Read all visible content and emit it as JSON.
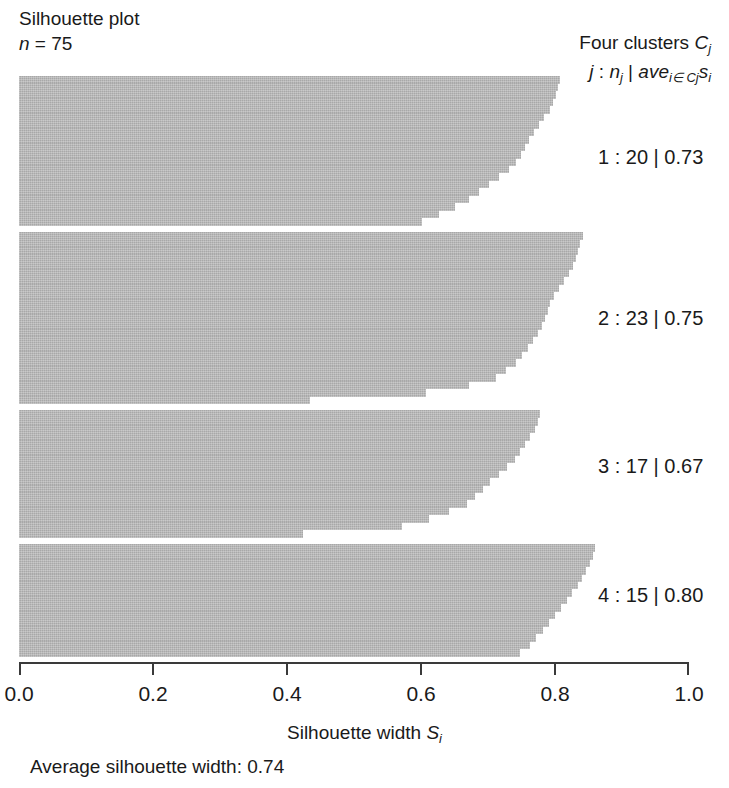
{
  "header": {
    "title": "Silhouette plot",
    "n_label_italic": "n",
    "n_label_rest": " = 75"
  },
  "legend": {
    "line1_text": "Four clusters ",
    "line1_var": "C",
    "line1_sub": "j",
    "line2": {
      "j": "j",
      "colon": " : ",
      "n": "n",
      "n_sub": "j",
      "pipe": " | ",
      "ave": "ave",
      "ave_sub": "i∈ Cj",
      "s": "s",
      "s_sub": "i"
    }
  },
  "cluster_labels": [
    "1 : 20 | 0.73",
    "2 : 23 | 0.75",
    "3 : 17 | 0.67",
    "4 : 15 | 0.80"
  ],
  "axis": {
    "ticks": [
      "0.0",
      "0.2",
      "0.4",
      "0.6",
      "0.8",
      "1.0"
    ],
    "tick_values": [
      0.0,
      0.2,
      0.4,
      0.6,
      0.8,
      1.0
    ],
    "title_text": "Silhouette width ",
    "title_var": "S",
    "title_sub": "i"
  },
  "footer": {
    "average_note": "Average silhouette width: 0.74"
  },
  "colors": {
    "bar_fill": "#b4b4b4",
    "axis": "#3a3a3a",
    "text": "#1a1a1a",
    "background": "#ffffff"
  },
  "chart_data": {
    "type": "bar",
    "title": "Silhouette plot",
    "subtitle": "n = 75",
    "xlabel": "Silhouette width S_i",
    "ylabel": "",
    "xlim": [
      0.0,
      1.0
    ],
    "grid": false,
    "legend_position": "right",
    "orientation": "horizontal",
    "n_total": 75,
    "average_silhouette_width": 0.74,
    "clusters": [
      {
        "id": 1,
        "label": "1 : 20 | 0.73",
        "size": 20,
        "average_silhouette": 0.73,
        "values": [
          0.807,
          0.805,
          0.801,
          0.797,
          0.793,
          0.784,
          0.776,
          0.769,
          0.761,
          0.755,
          0.749,
          0.742,
          0.731,
          0.716,
          0.701,
          0.687,
          0.672,
          0.651,
          0.627,
          0.601
        ]
      },
      {
        "id": 2,
        "label": "2 : 23 | 0.75",
        "size": 23,
        "average_silhouette": 0.75,
        "values": [
          0.842,
          0.838,
          0.835,
          0.831,
          0.827,
          0.821,
          0.814,
          0.806,
          0.798,
          0.793,
          0.789,
          0.785,
          0.781,
          0.775,
          0.767,
          0.759,
          0.751,
          0.742,
          0.727,
          0.712,
          0.672,
          0.607,
          0.434
        ]
      },
      {
        "id": 3,
        "label": "3 : 17 | 0.67",
        "size": 17,
        "average_silhouette": 0.67,
        "values": [
          0.778,
          0.774,
          0.77,
          0.763,
          0.755,
          0.748,
          0.74,
          0.729,
          0.716,
          0.703,
          0.692,
          0.681,
          0.668,
          0.642,
          0.612,
          0.571,
          0.424
        ]
      },
      {
        "id": 4,
        "label": "4 : 15 | 0.80",
        "size": 15,
        "average_silhouette": 0.8,
        "values": [
          0.86,
          0.856,
          0.852,
          0.847,
          0.841,
          0.834,
          0.826,
          0.818,
          0.809,
          0.8,
          0.791,
          0.782,
          0.772,
          0.762,
          0.748
        ]
      }
    ]
  }
}
